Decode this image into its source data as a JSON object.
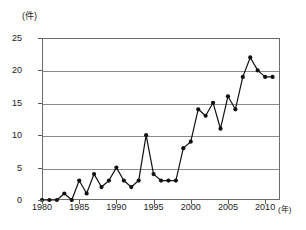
{
  "chart_data": {
    "type": "line",
    "title": "",
    "xlabel": "(年)",
    "ylabel": "(件)",
    "xlim": [
      1980,
      2012
    ],
    "ylim": [
      0,
      25
    ],
    "grid": true,
    "legend": "none",
    "y_ticks": [
      0,
      5,
      10,
      15,
      20,
      25
    ],
    "y_tick_labels": [
      "0",
      "5",
      "10",
      "15",
      "20",
      "25"
    ],
    "x_ticks": [
      1980,
      1985,
      1990,
      1995,
      2000,
      2005,
      2010
    ],
    "x_tick_labels": [
      "1980",
      "1985",
      "1990",
      "1995",
      "2000",
      "2005",
      "2010"
    ],
    "marker": "filled-circle",
    "marker_color": "#111111",
    "line_color": "#111111",
    "x": [
      1980,
      1981,
      1982,
      1983,
      1984,
      1985,
      1986,
      1987,
      1988,
      1989,
      1990,
      1991,
      1992,
      1993,
      1994,
      1995,
      1996,
      1997,
      1998,
      1999,
      2000,
      2001,
      2002,
      2003,
      2004,
      2005,
      2006,
      2007,
      2008,
      2009,
      2010,
      2011
    ],
    "values": [
      0,
      0,
      0,
      1,
      0,
      3,
      1,
      4,
      2,
      3,
      5,
      3,
      2,
      3,
      10,
      4,
      3,
      3,
      3,
      8,
      9,
      14,
      13,
      15,
      11,
      16,
      14,
      19,
      22,
      20,
      19,
      19
    ],
    "series": [
      {
        "name": "件数",
        "values": [
          0,
          0,
          0,
          1,
          0,
          3,
          1,
          4,
          2,
          3,
          5,
          3,
          2,
          3,
          10,
          4,
          3,
          3,
          3,
          8,
          9,
          14,
          13,
          15,
          11,
          16,
          14,
          19,
          22,
          20,
          19,
          19
        ]
      }
    ]
  },
  "axes": {
    "y_unit": "(件)",
    "x_unit": "(年)"
  },
  "colors": {
    "line": "#111111",
    "marker": "#111111",
    "grid": "#8a8a8a",
    "frame": "#6b6b6b",
    "text": "#1a1a1a",
    "background": "#ffffff"
  }
}
